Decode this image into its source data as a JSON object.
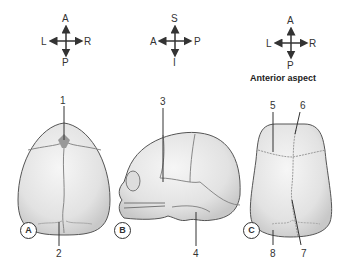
{
  "compass": [
    {
      "id": "A",
      "up": "A",
      "down": "P",
      "left": "L",
      "right": "R"
    },
    {
      "id": "B",
      "up": "S",
      "down": "I",
      "left": "A",
      "right": "P"
    },
    {
      "id": "C",
      "up": "A",
      "down": "P",
      "left": "L",
      "right": "R",
      "caption": "Anterior aspect"
    }
  ],
  "panels": [
    {
      "label": "A",
      "view": "superior",
      "numbers": [
        "1",
        "2"
      ]
    },
    {
      "label": "B",
      "view": "lateral",
      "numbers": [
        "3",
        "4"
      ]
    },
    {
      "label": "C",
      "view": "anterior",
      "numbers": [
        "5",
        "6",
        "7",
        "8"
      ]
    }
  ],
  "colors": {
    "skull_fill": "#e4e4e4",
    "outline": "#555555",
    "suture": "#8a8a8a",
    "text": "#333333"
  }
}
